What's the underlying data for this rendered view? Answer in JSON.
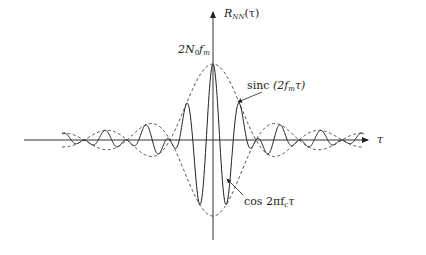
{
  "figure": {
    "axes": {
      "x_label": "τ",
      "y_label_main": "R",
      "y_label_sub": "NN",
      "y_label_arg": "(τ)"
    },
    "peak_label": {
      "main": "2N",
      "sub0": "0",
      "f": "f",
      "subm": "m"
    },
    "annotations": {
      "envelope": {
        "func": "sinc",
        "arg_open": "(2f",
        "sub": "m",
        "arg_close": "τ)"
      },
      "carrier": {
        "func": "cos 2πf",
        "sub": "c",
        "tail": "τ"
      }
    },
    "colors": {
      "axis": "#333333",
      "curve": "#222222",
      "envelope": "#444444"
    },
    "geometry": {
      "origin_x": 213,
      "axis_y": 140,
      "peak_y": 64,
      "x_start": 24,
      "x_end": 368,
      "y_top": 12,
      "y_bottom": 240
    }
  }
}
